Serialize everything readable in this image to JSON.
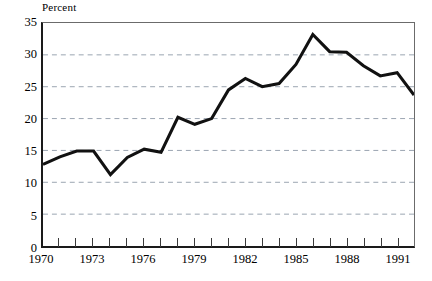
{
  "chart_data": {
    "type": "line",
    "title": "",
    "subtitle": "",
    "xlabel": "",
    "ylabel": "Percent",
    "y_unit_label": "Percent",
    "xlim": [
      1970,
      1992
    ],
    "ylim": [
      0,
      35
    ],
    "yticks": [
      0,
      5,
      10,
      15,
      20,
      25,
      30,
      35
    ],
    "ytick_labels": [
      "0",
      "5",
      "10",
      "15",
      "20",
      "25",
      "30",
      "35"
    ],
    "xticks": [
      1970,
      1971,
      1972,
      1973,
      1974,
      1975,
      1976,
      1977,
      1978,
      1979,
      1980,
      1981,
      1982,
      1983,
      1984,
      1985,
      1986,
      1987,
      1988,
      1989,
      1990,
      1991,
      1992
    ],
    "xtick_labels_shown": [
      "1970",
      "1973",
      "1976",
      "1979",
      "1982",
      "1985",
      "1988",
      "1991"
    ],
    "xtick_label_values": [
      1970,
      1973,
      1976,
      1979,
      1982,
      1985,
      1988,
      1991
    ],
    "grid": "horizontal-dashed",
    "legend": "none",
    "line_color": "#111111",
    "grid_color": "#9aa4b0",
    "axis_color": "#1a1a1a",
    "background_color": "#ffffff",
    "x": [
      1970,
      1971,
      1972,
      1973,
      1974,
      1975,
      1976,
      1977,
      1978,
      1979,
      1980,
      1981,
      1982,
      1983,
      1984,
      1985,
      1986,
      1987,
      1988,
      1989,
      1990,
      1991,
      1992
    ],
    "values": [
      12.8,
      14.0,
      14.9,
      14.9,
      11.2,
      13.9,
      15.2,
      14.7,
      20.2,
      19.1,
      20.0,
      24.5,
      26.3,
      25.0,
      25.5,
      28.5,
      33.2,
      30.5,
      30.4,
      28.3,
      26.7,
      27.2,
      23.7
    ],
    "annotations": []
  }
}
